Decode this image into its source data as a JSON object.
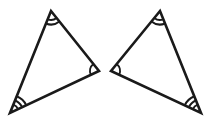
{
  "figure": {
    "kind": "geometry-diagram",
    "background_color": "#ffffff",
    "stroke_color": "#1a1a1a",
    "stroke_width": 2.6,
    "arc_stroke_width": 2.0,
    "canvas": {
      "width": 211,
      "height": 125
    },
    "shapes": [
      {
        "name": "triangle-left",
        "label": "",
        "orientation": "original",
        "vertices": [
          {
            "name": "apex",
            "x": 51,
            "y": 11,
            "marks": 2
          },
          {
            "name": "right",
            "x": 99,
            "y": 71,
            "marks": 1
          },
          {
            "name": "bottom-left",
            "x": 10,
            "y": 113,
            "marks": 3
          }
        ]
      },
      {
        "name": "triangle-right",
        "label": "",
        "orientation": "mirrored",
        "vertices": [
          {
            "name": "apex",
            "x": 160,
            "y": 11,
            "marks": 2
          },
          {
            "name": "left",
            "x": 111,
            "y": 71,
            "marks": 1
          },
          {
            "name": "bottom-right",
            "x": 201,
            "y": 113,
            "marks": 3
          }
        ]
      }
    ],
    "arc_radii": [
      9,
      13.5,
      18
    ]
  }
}
